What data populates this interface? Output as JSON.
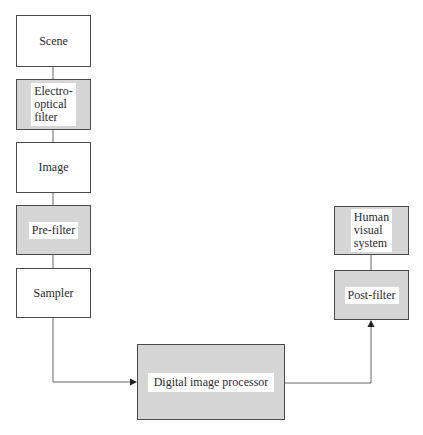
{
  "diagram": {
    "nodes": [
      {
        "id": "scene",
        "label": "Scene",
        "style": "white"
      },
      {
        "id": "electro-optical-filter",
        "label": "Electro-\noptical\nfilter",
        "style": "shaded"
      },
      {
        "id": "image",
        "label": "Image",
        "style": "white"
      },
      {
        "id": "pre-filter",
        "label": "Pre-filter",
        "style": "shaded"
      },
      {
        "id": "sampler",
        "label": "Sampler",
        "style": "white"
      },
      {
        "id": "digital-image-processor",
        "label": "Digital image processor",
        "style": "shaded"
      },
      {
        "id": "post-filter",
        "label": "Post-filter",
        "style": "shaded"
      },
      {
        "id": "human-visual-system",
        "label": "Human\nvisual\nsystem",
        "style": "shaded"
      }
    ],
    "edges": [
      {
        "from": "scene",
        "to": "electro-optical-filter",
        "arrow": false
      },
      {
        "from": "electro-optical-filter",
        "to": "image",
        "arrow": false
      },
      {
        "from": "image",
        "to": "pre-filter",
        "arrow": false
      },
      {
        "from": "pre-filter",
        "to": "sampler",
        "arrow": false
      },
      {
        "from": "sampler",
        "to": "digital-image-processor",
        "arrow": true
      },
      {
        "from": "digital-image-processor",
        "to": "post-filter",
        "arrow": true
      },
      {
        "from": "post-filter",
        "to": "human-visual-system",
        "arrow": false
      }
    ],
    "colors": {
      "shaded_fill": "#d6d6d6",
      "border": "#4a4a4a",
      "line": "#555555"
    }
  }
}
